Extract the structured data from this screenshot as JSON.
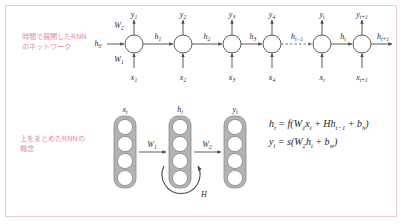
{
  "figure": {
    "border_color": "#e9cdd8",
    "background": "#ffffff",
    "label_color": "#e08fab",
    "node_stroke": "#4a4a4a",
    "layer_fill": "#b3b3b3"
  },
  "annotations": {
    "top_label": "時間で展開したRNN\nのネットワーク",
    "bottom_label": "上をまとめたRNNの\n概念"
  },
  "unrolled_network": {
    "initial_state": "h0",
    "weight_upper": "W2",
    "weight_lower": "W1",
    "nodes": [
      {
        "input": "x1",
        "output": "y1",
        "state_out": "h1"
      },
      {
        "input": "x2",
        "output": "y2",
        "state_out": "h2"
      },
      {
        "input": "x3",
        "output": "y3",
        "state_out": "h3"
      },
      {
        "input": "x4",
        "output": "y4",
        "state_out": ""
      },
      {
        "input": "xt",
        "output": "yt",
        "state_out": "ht"
      },
      {
        "input": "xt+1",
        "output": "yt+1",
        "state_out": "ht+1"
      }
    ],
    "dashed_edge_label": "ht-1",
    "input_labels": [
      "x1",
      "x2",
      "x3",
      "x4",
      "xt",
      "xt+1"
    ],
    "output_labels": [
      "y1",
      "y2",
      "y3",
      "y4",
      "yt",
      "yt+1"
    ],
    "state_labels": [
      "h1",
      "h2",
      "h3",
      "ht-1",
      "ht",
      "ht+1"
    ],
    "input_subscripts": [
      "1",
      "2",
      "3",
      "4",
      "t",
      "t+1"
    ],
    "output_subscripts": [
      "1",
      "2",
      "3",
      "4",
      "t",
      "t+1"
    ],
    "state_subscripts": [
      "1",
      "2",
      "3",
      "t-1",
      "t",
      "t+1"
    ]
  },
  "folded_network": {
    "layers": [
      {
        "label": "x",
        "subscript": "t",
        "units": 4
      },
      {
        "label": "h",
        "subscript": "t",
        "units": 4
      },
      {
        "label": "y",
        "subscript": "t",
        "units": 4
      }
    ],
    "weights": [
      "W1",
      "W2"
    ],
    "weight_labels": [
      {
        "base": "W",
        "sub": "1"
      },
      {
        "base": "W",
        "sub": "2"
      }
    ],
    "recurrent_label": "H"
  },
  "equations": {
    "hidden_state": "h_t = f(W_1 x_t + H h_{t-1} + b_h)",
    "output": "y_t = s(W_2 h_t + b_w)"
  }
}
